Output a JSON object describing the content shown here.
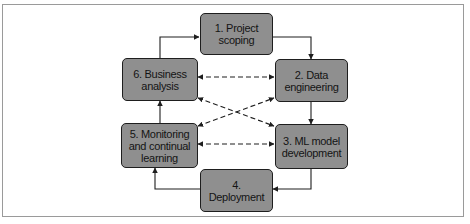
{
  "diagram": {
    "type": "cycle",
    "nodes": [
      {
        "id": "n1",
        "label": "1. Project scoping",
        "lines": [
          "1. Project",
          "scoping"
        ]
      },
      {
        "id": "n2",
        "label": "2. Data engineering",
        "lines": [
          "2. Data",
          "engineering"
        ]
      },
      {
        "id": "n3",
        "label": "3. ML model development",
        "lines": [
          "3. ML model",
          "development"
        ]
      },
      {
        "id": "n4",
        "label": "4. Deployment",
        "lines": [
          "4. Deployment"
        ]
      },
      {
        "id": "n5",
        "label": "5. Monitoring and continual learning",
        "lines": [
          "5. Monitoring",
          "and continual",
          "learning"
        ]
      },
      {
        "id": "n6",
        "label": "6. Business analysis",
        "lines": [
          "6. Business",
          "analysis"
        ]
      }
    ],
    "edges": [
      {
        "from": "n1",
        "to": "n2",
        "style": "solid",
        "direction": "forward"
      },
      {
        "from": "n2",
        "to": "n3",
        "style": "solid",
        "direction": "forward"
      },
      {
        "from": "n3",
        "to": "n4",
        "style": "solid",
        "direction": "forward"
      },
      {
        "from": "n4",
        "to": "n5",
        "style": "solid",
        "direction": "forward"
      },
      {
        "from": "n5",
        "to": "n6",
        "style": "solid",
        "direction": "forward"
      },
      {
        "from": "n6",
        "to": "n1",
        "style": "solid",
        "direction": "forward"
      },
      {
        "from": "n6",
        "to": "n2",
        "style": "dashed",
        "direction": "both"
      },
      {
        "from": "n5",
        "to": "n3",
        "style": "dashed",
        "direction": "both"
      },
      {
        "from": "n6",
        "to": "n3",
        "style": "dashed",
        "direction": "both"
      },
      {
        "from": "n5",
        "to": "n2",
        "style": "dashed",
        "direction": "both"
      }
    ]
  },
  "colors": {
    "node_fill": "#8f8f8f",
    "node_border": "#1e1e1e",
    "edge": "#1e1e1e",
    "frame": "#9a9a9a",
    "background": "#ffffff"
  }
}
